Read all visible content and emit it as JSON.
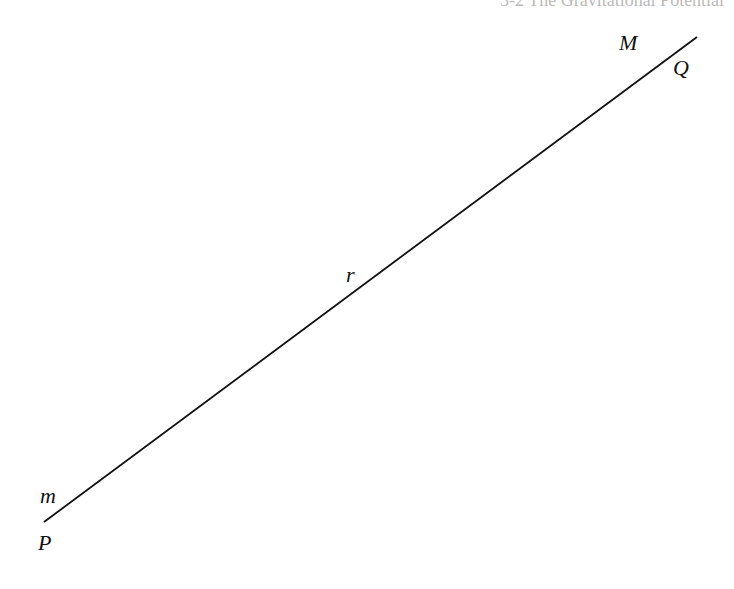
{
  "header": {
    "text": "3-2 The Gravitational Potential"
  },
  "diagram": {
    "line": {
      "x1": 44,
      "y1": 522,
      "x2": 697,
      "y2": 37,
      "color": "#111111"
    },
    "labels": {
      "M": "M",
      "Q": "Q",
      "r": "r",
      "m": "m",
      "P": "P"
    }
  }
}
